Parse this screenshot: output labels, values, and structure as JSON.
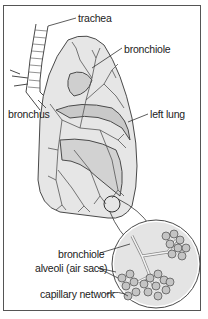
{
  "diagram": {
    "labels": {
      "trachea": "trachea",
      "bronchiole_top": "bronchiole",
      "bronchus": "bronchus",
      "left_lung": "left lung",
      "bronchiole_inset": "bronchiole",
      "alveoli": "alveoli (air sacs)",
      "capillary_network": "capillary network"
    },
    "colors": {
      "line": "#4a4a4a",
      "lung_fill": "#dcdcdc",
      "lobe_fill": "#c8c8c8",
      "inset_fill": "#d6d6d6",
      "alveoli_fill": "#bfbfbf",
      "background": "#ffffff"
    }
  }
}
